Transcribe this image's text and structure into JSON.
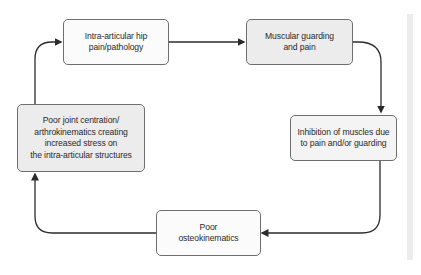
{
  "diagram": {
    "type": "cycle-flowchart",
    "direction": "clockwise",
    "nodes": [
      {
        "id": "n1",
        "label": "Intra-articular hip\npain/pathology",
        "fill": "#fbfbfb"
      },
      {
        "id": "n2",
        "label": "Muscular guarding\nand pain",
        "fill": "#ececec"
      },
      {
        "id": "n3",
        "label": "Inhibition of muscles due\nto pain and/or guarding",
        "fill": "#f4f4f4"
      },
      {
        "id": "n4",
        "label": "Poor\nosteokinematics",
        "fill": "#fbfbfb"
      },
      {
        "id": "n5",
        "label": "Poor joint centration/\narthrokinematics creating\nincreased stress on\nthe intra-articular structures",
        "fill": "#ececec"
      }
    ],
    "edges": [
      {
        "from": "n1",
        "to": "n2"
      },
      {
        "from": "n2",
        "to": "n3"
      },
      {
        "from": "n3",
        "to": "n4"
      },
      {
        "from": "n4",
        "to": "n5"
      },
      {
        "from": "n5",
        "to": "n1"
      }
    ],
    "colors": {
      "border": "#6e6e6e",
      "arrow": "#2b2b2b",
      "text": "#2a2a2a"
    }
  }
}
